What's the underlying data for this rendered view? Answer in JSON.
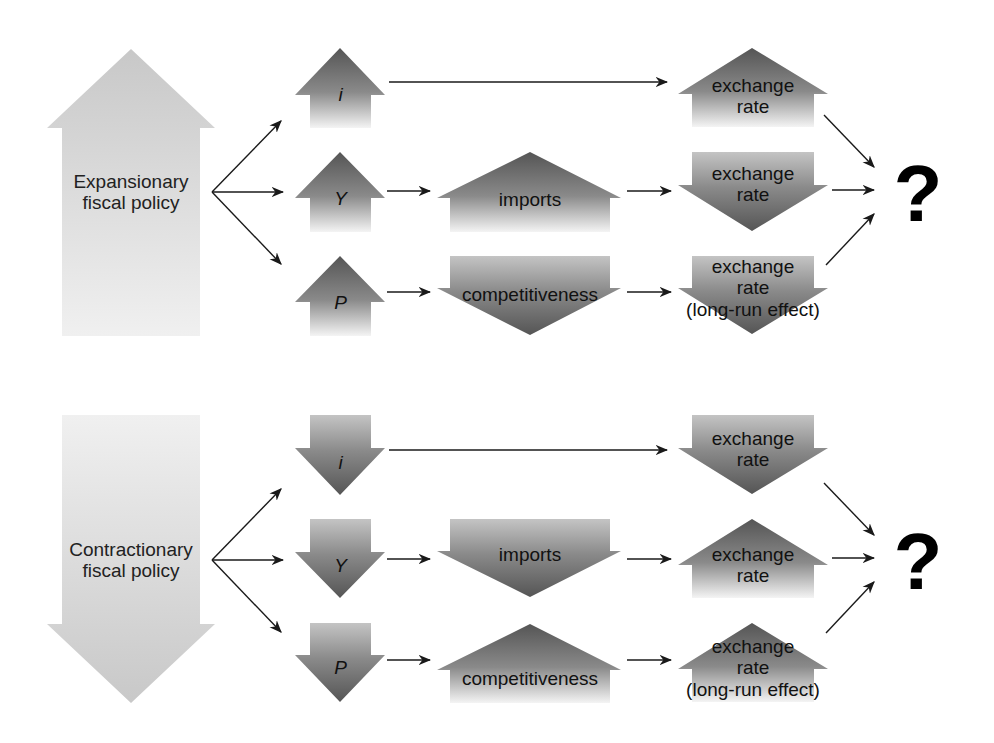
{
  "colors": {
    "background": "#ffffff",
    "policy_arrow": "#cfcfcf",
    "effect_arrow_dark": "#5f5f5f",
    "effect_arrow_light": "#f2f2f2",
    "connector": "#1a1a1a"
  },
  "panels": [
    {
      "id": "expansionary",
      "policy": {
        "label_line1": "Expansionary",
        "label_line2": "fiscal policy",
        "direction": "up"
      },
      "rows": [
        {
          "variable": "i",
          "variable_direction": "up",
          "intermediate": null,
          "exchange_rate": {
            "line1": "exchange",
            "line2": "rate",
            "line3": "",
            "direction": "up"
          }
        },
        {
          "variable": "Y",
          "variable_direction": "up",
          "intermediate": {
            "label": "imports",
            "direction": "up"
          },
          "exchange_rate": {
            "line1": "exchange",
            "line2": "rate",
            "line3": "",
            "direction": "down"
          }
        },
        {
          "variable": "P",
          "variable_direction": "up",
          "intermediate": {
            "label": "competitiveness",
            "direction": "down"
          },
          "exchange_rate": {
            "line1": "exchange",
            "line2": "rate",
            "line3": "(long-run effect)",
            "direction": "down"
          }
        }
      ],
      "outcome": "?"
    },
    {
      "id": "contractionary",
      "policy": {
        "label_line1": "Contractionary",
        "label_line2": "fiscal policy",
        "direction": "down"
      },
      "rows": [
        {
          "variable": "i",
          "variable_direction": "down",
          "intermediate": null,
          "exchange_rate": {
            "line1": "exchange",
            "line2": "rate",
            "line3": "",
            "direction": "down"
          }
        },
        {
          "variable": "Y",
          "variable_direction": "down",
          "intermediate": {
            "label": "imports",
            "direction": "down"
          },
          "exchange_rate": {
            "line1": "exchange",
            "line2": "rate",
            "line3": "",
            "direction": "up"
          }
        },
        {
          "variable": "P",
          "variable_direction": "down",
          "intermediate": {
            "label": "competitiveness",
            "direction": "up"
          },
          "exchange_rate": {
            "line1": "exchange",
            "line2": "rate",
            "line3": "(long-run effect)",
            "direction": "up"
          }
        }
      ],
      "outcome": "?"
    }
  ]
}
